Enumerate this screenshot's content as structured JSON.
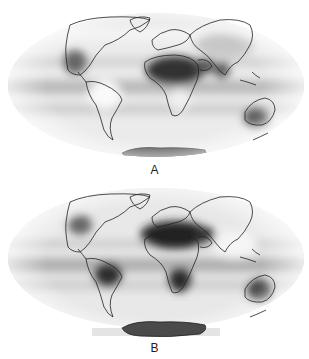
{
  "figure": {
    "projection": "Mollweide world map",
    "colormap": "grayscale (light = low, dark = high)",
    "panels": [
      {
        "id": "A",
        "label": "A",
        "dark_regions": [
          "North Africa / Sahara",
          "Arabian Peninsula",
          "India",
          "Australia",
          "Antarctica",
          "central North America",
          "equatorial Pacific band"
        ],
        "light_regions": [
          "South America",
          "southern Africa",
          "high northern latitudes"
        ]
      },
      {
        "id": "B",
        "label": "B",
        "dark_regions": [
          "Sahara / North Africa",
          "Arabian Peninsula",
          "southern Africa",
          "central South America",
          "Australia",
          "Antarctica",
          "equatorial Pacific band",
          "eastern North America"
        ],
        "light_regions": [
          "Asia",
          "India",
          "high latitudes"
        ]
      }
    ]
  }
}
